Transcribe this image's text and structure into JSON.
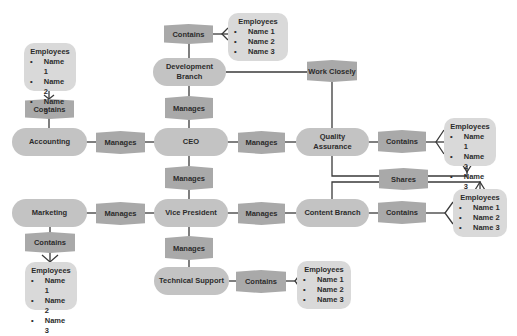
{
  "colors": {
    "entity_fill": "#c3c3c3",
    "relationship_fill": "#a9a9a9",
    "employees_fill": "#d9d9d9",
    "line": "#3a3a3a",
    "text": "#2b2b2b"
  },
  "entities": {
    "ceo": "CEO",
    "development_branch": "Development Branch",
    "accounting": "Accounting",
    "quality_assurance": "Quality Assurance",
    "vice_president": "Vice President",
    "marketing": "Marketing",
    "content_branch": "Content Branch",
    "technical_support": "Technical Support"
  },
  "relationships": {
    "dev_contains": "Contains",
    "dev_manages": "Manages",
    "accounting_contains": "Contains",
    "ceo_accounting_manages": "Manages",
    "ceo_qa_manages": "Manages",
    "work_closely": "Work Closely",
    "qa_contains": "Contains",
    "shares": "Shares",
    "ceo_vp_manages": "Manages",
    "vp_marketing_manages": "Manages",
    "vp_content_manages": "Manages",
    "content_contains": "Contains",
    "marketing_contains": "Contains",
    "vp_support_manages": "Manages",
    "support_contains": "Contains"
  },
  "employee_groups": {
    "development": {
      "title": "Employees",
      "names": [
        "Name 1",
        "Name 2",
        "Name 3"
      ]
    },
    "accounting": {
      "title": "Employees",
      "names": [
        "Name 1",
        "Name 2",
        "Name 3"
      ]
    },
    "quality_assurance": {
      "title": "Employees",
      "names": [
        "Name 1",
        "Name 2",
        "Name 3"
      ]
    },
    "content_branch": {
      "title": "Employees",
      "names": [
        "Name 1",
        "Name 2",
        "Name 3"
      ]
    },
    "marketing": {
      "title": "Employees",
      "names": [
        "Name 1",
        "Name 2",
        "Name 3"
      ]
    },
    "technical_support": {
      "title": "Employees",
      "names": [
        "Name 1",
        "Name 2",
        "Name 3"
      ]
    }
  },
  "bullet": "•"
}
